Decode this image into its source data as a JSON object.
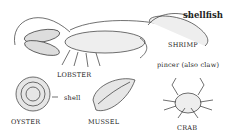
{
  "title": "shellfish",
  "labels": {
    "lobster": "LOBSTER",
    "shrimp": "SHRIMP",
    "oyster": "OYSTER",
    "mussel": "MUSSEL",
    "crab": "CRAB",
    "shell": "shell",
    "pincer": "pincer (also claw)"
  }
}
